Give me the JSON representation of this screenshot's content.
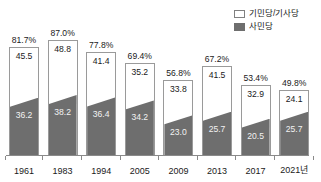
{
  "legend": {
    "items": [
      {
        "label": "기민당/기사당",
        "swatch": "outline-box-icon",
        "style": "upper"
      },
      {
        "label": "사민당",
        "swatch": "filled-box-icon",
        "style": "lower"
      }
    ]
  },
  "chart_data": {
    "type": "bar",
    "title": "",
    "xlabel": "",
    "ylabel": "",
    "ylim": [
      0,
      90
    ],
    "grid": false,
    "legend_position": "top-right",
    "categories": [
      "1961",
      "1983",
      "1994",
      "2005",
      "2009",
      "2013",
      "2017",
      "2021년"
    ],
    "totals": [
      81.7,
      87.0,
      77.8,
      69.4,
      56.8,
      67.2,
      53.4,
      49.8
    ],
    "total_labels": [
      "81.7%",
      "87.0%",
      "77.8%",
      "69.4%",
      "56.8%",
      "67.2%",
      "53.4%",
      "49.8%"
    ],
    "series": [
      {
        "name": "기민당/기사당",
        "values": [
          45.5,
          48.8,
          41.4,
          35.2,
          33.8,
          41.5,
          32.9,
          24.1
        ],
        "labels": [
          "45.5",
          "48.8",
          "41.4",
          "35.2",
          "33.8",
          "41.5",
          "32.9",
          "24.1"
        ]
      },
      {
        "name": "사민당",
        "values": [
          36.2,
          38.2,
          36.4,
          34.2,
          23.0,
          25.7,
          20.5,
          25.7
        ],
        "labels": [
          "36.2",
          "38.2",
          "36.4",
          "34.2",
          "23.0",
          "25.7",
          "20.5",
          "25.7"
        ]
      }
    ]
  },
  "colors": {
    "upper_fill": "#ffffff",
    "upper_border": "#9a9a9a",
    "lower_fill": "#6e6e6e",
    "axis": "#8a8a8a",
    "text": "#1a1a1a",
    "lower_text": "#f2f2f2",
    "background": "#ffffff"
  }
}
